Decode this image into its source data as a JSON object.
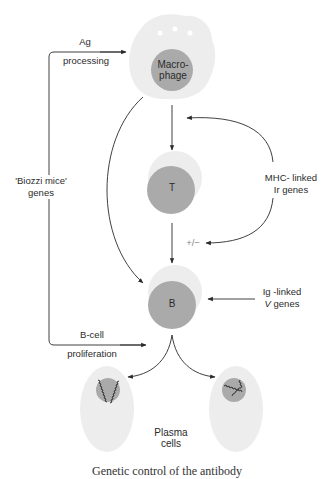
{
  "diagram": {
    "cells": {
      "macrophage": {
        "label_line1": "Macro-",
        "label_line2": "phage"
      },
      "t_cell": {
        "label": "T"
      },
      "b_cell": {
        "label": "B"
      },
      "plasma_cells": {
        "label_line1": "Plasma",
        "label_line2": "cells"
      }
    },
    "annotations": {
      "ag": "Ag",
      "processing": "processing",
      "biozzi_line1": "'Biozzi mice'",
      "biozzi_line2": "genes",
      "mhc_line1": "MHC- linked",
      "mhc_line2": "Ir genes",
      "plus_minus": "+/−",
      "ig_line1": "Ig -linked",
      "ig_v": "V",
      "ig_genes": "genes",
      "b_cell": "B-cell",
      "proliferation": "proliferation"
    },
    "caption": "Genetic control of the antibody"
  },
  "colors": {
    "cytoplasm": "#ececec",
    "nucleus": "#a9a9a9",
    "line": "#2a2a2a",
    "text": "#2b2b2b"
  }
}
